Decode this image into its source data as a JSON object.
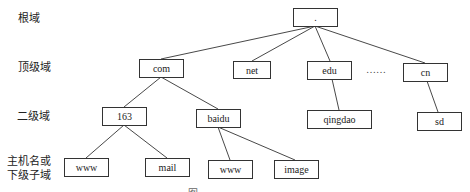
{
  "levels": [
    {
      "label": "根域"
    },
    {
      "label": "顶级域"
    },
    {
      "label": "二级域"
    },
    {
      "label": "主机名或\n下级子域",
      "line1": "主机名或",
      "line2": "下级子域"
    }
  ],
  "nodes": {
    "root": ".",
    "com": "com",
    "net": "net",
    "edu": "edu",
    "cn": "cn",
    "n163": "163",
    "baidu": "baidu",
    "qingdao": "qingdao",
    "sd": "sd",
    "www1": "www",
    "mail": "mail",
    "www2": "www",
    "image": "image"
  },
  "ellipsis": "……",
  "caption": "图",
  "edges": [
    [
      "root",
      "com"
    ],
    [
      "root",
      "net"
    ],
    [
      "root",
      "edu"
    ],
    [
      "root",
      "cn"
    ],
    [
      "com",
      "163"
    ],
    [
      "com",
      "baidu"
    ],
    [
      "edu",
      "qingdao"
    ],
    [
      "cn",
      "sd"
    ],
    [
      "163",
      "www"
    ],
    [
      "163",
      "mail"
    ],
    [
      "baidu",
      "www"
    ],
    [
      "baidu",
      "image"
    ]
  ]
}
